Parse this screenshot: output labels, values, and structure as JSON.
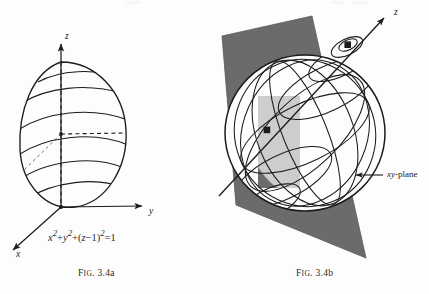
{
  "page": {
    "background_color": "#fdfdfd",
    "ink_color": "#1c1c1c",
    "plane_fill": "#6b6b6b",
    "disk_fill": "#cdcdcd"
  },
  "figure_a": {
    "caption_prefix": "F",
    "caption_smallcaps": "IG",
    "caption_suffix": ". 3.4a",
    "caption_full": "FIG. 3.4a",
    "equation": "x² + y² + (z − 1)² = 1",
    "equation_parts": {
      "x_term": "x",
      "x_exp": "2",
      "y_term": "y",
      "y_exp": "2",
      "z_term": "z",
      "z_offset": "1",
      "z_exp": "2",
      "rhs": "1",
      "plus": "+",
      "minus": "−",
      "equals": "="
    },
    "axes": [
      {
        "name": "z-axis",
        "label": "z"
      },
      {
        "name": "y-axis",
        "label": "y"
      },
      {
        "name": "x-axis",
        "label": "x"
      }
    ],
    "description": "Sphere of radius 1 centered at (0,0,1) tangent to the xy-plane at the origin, drawn with latitude bands."
  },
  "figure_b": {
    "caption_prefix": "F",
    "caption_smallcaps": "IG",
    "caption_suffix": ". 3.4b",
    "caption_full": "FIG. 3.4b",
    "axis_label_z": "z",
    "plane_label_prefix": "xy",
    "plane_label_suffix": "-plane",
    "plane_label_full": "xy-plane",
    "points": [
      {
        "name": "north-pole-point"
      },
      {
        "name": "sphere-center-point"
      }
    ],
    "description": "Sphere crossed by a tilted z-axis meeting a shaded xy-plane; the plane cuts the sphere in a light elliptical disk."
  }
}
